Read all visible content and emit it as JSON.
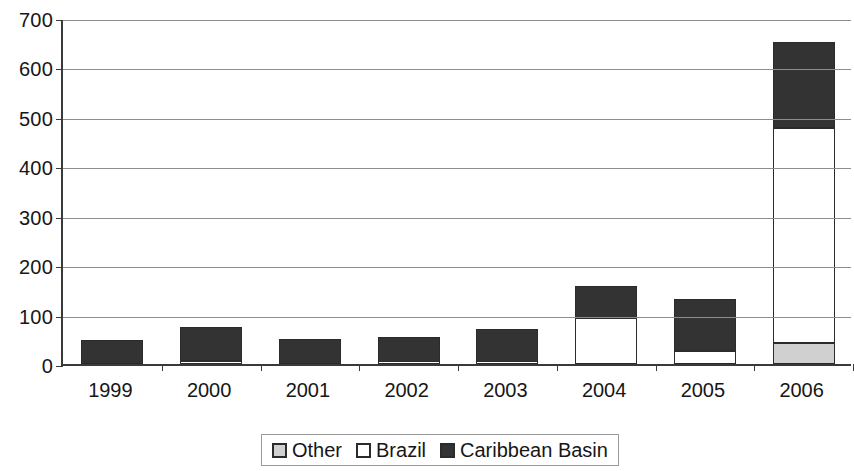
{
  "chart_data": {
    "type": "bar",
    "stacked": true,
    "title": "",
    "subtitle": "",
    "xlabel": "",
    "ylabel": "",
    "categories": [
      "1999",
      "2000",
      "2001",
      "2002",
      "2003",
      "2004",
      "2005",
      "2006"
    ],
    "series": [
      {
        "name": "Other",
        "color": "#d0d0d0",
        "values": [
          0,
          0,
          0,
          0,
          0,
          0,
          0,
          42
        ]
      },
      {
        "name": "Brazil",
        "color": "#ffffff",
        "values": [
          0,
          7,
          0,
          5,
          4,
          93,
          27,
          435
        ]
      },
      {
        "name": "Caribbean Basin",
        "color": "#333333",
        "values": [
          48,
          67,
          51,
          50,
          66,
          65,
          104,
          175
        ]
      }
    ],
    "totals": [
      48,
      74,
      51,
      55,
      70,
      158,
      131,
      652
    ],
    "ylim": [
      0,
      700
    ],
    "yticks": [
      0,
      100,
      200,
      300,
      400,
      500,
      600,
      700
    ],
    "ytick_labels": [
      "0",
      "100",
      "200",
      "300",
      "400",
      "500",
      "600",
      "700"
    ],
    "grid": true,
    "legend_position": "bottom"
  },
  "legend": {
    "items": [
      {
        "label": "Other",
        "swatch": "legend-swatch-other"
      },
      {
        "label": "Brazil",
        "swatch": "legend-swatch-brazil"
      },
      {
        "label": "Caribbean Basin",
        "swatch": "legend-swatch-caribbean-basin"
      }
    ]
  }
}
